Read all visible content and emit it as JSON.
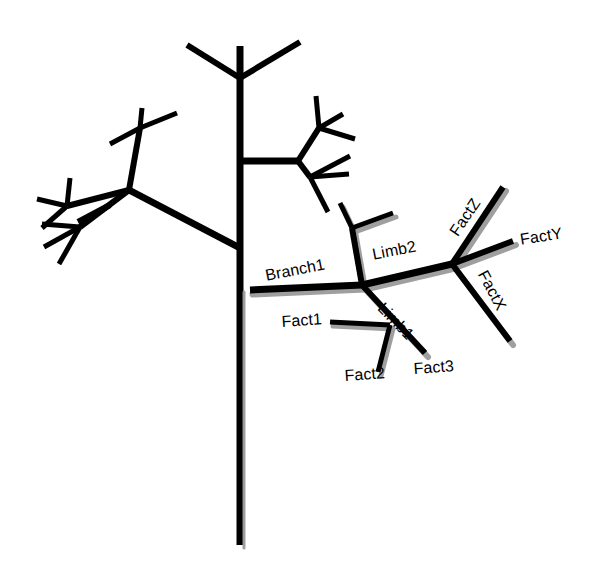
{
  "diagram": {
    "type": "fractal-branching-tree",
    "background_color": "#ffffff",
    "line_color": "#000000",
    "shadow_color": "#9a9a9a",
    "title": "",
    "labels": [
      {
        "id": "branch1",
        "text": "Branch1",
        "x": 264,
        "y": 268,
        "rotate": -11
      },
      {
        "id": "limb2",
        "text": "Limb2",
        "x": 371,
        "y": 247,
        "rotate": -11
      },
      {
        "id": "limb1",
        "text": "Limb1",
        "x": 386,
        "y": 300,
        "rotate": 46
      },
      {
        "id": "fact1",
        "text": "Fact1",
        "x": 281,
        "y": 314,
        "rotate": -4
      },
      {
        "id": "fact2",
        "text": "Fact2",
        "x": 344,
        "y": 368,
        "rotate": -4
      },
      {
        "id": "fact3",
        "text": "Fact3",
        "x": 413,
        "y": 361,
        "rotate": -4
      },
      {
        "id": "factx",
        "text": "FactX",
        "x": 489,
        "y": 268,
        "rotate": 62
      },
      {
        "id": "facty",
        "text": "FactY",
        "x": 519,
        "y": 232,
        "rotate": -9
      },
      {
        "id": "factz",
        "text": "FactZ",
        "x": 447,
        "y": 230,
        "rotate": -56
      }
    ],
    "labeled_nodes": [
      {
        "name": "trunk-branch1-junction",
        "x": 250,
        "y": 290
      },
      {
        "name": "branch1-limb-junction",
        "x": 362,
        "y": 285
      },
      {
        "name": "limb2-fact-junction",
        "x": 452,
        "y": 264
      },
      {
        "name": "limb1-fact-junction",
        "x": 390,
        "y": 325
      }
    ],
    "plain_branches": [
      {
        "name": "trunk",
        "d": "M 240 46 L 240 545"
      },
      {
        "name": "trunk-top-fork-left",
        "d": "M 240 78 L 187 45"
      },
      {
        "name": "trunk-top-fork-right",
        "d": "M 240 78 L 300 42"
      },
      {
        "name": "left-main-branch",
        "d": "M 240 248 L 129 190"
      },
      {
        "name": "left-upper-sub",
        "d": "M 129 190 L 140 128"
      },
      {
        "name": "left-upper-tip-a",
        "d": "M 140 128 L 110 144"
      },
      {
        "name": "left-upper-tip-b",
        "d": "M 140 128 L 142 108"
      },
      {
        "name": "left-upper-tip-c",
        "d": "M 140 128 L 177 113"
      },
      {
        "name": "left-lower-sub",
        "d": "M 129 190 L 67 206"
      },
      {
        "name": "left-lower-tip-a",
        "d": "M 67 206 L 70 178"
      },
      {
        "name": "left-lower-tip-b",
        "d": "M 67 206 L 37 199"
      },
      {
        "name": "left-lower-tip-c",
        "d": "M 67 206 L 42 228"
      },
      {
        "name": "left-mid-sub",
        "d": "M 110 205 L 78 222"
      },
      {
        "name": "left-mid-fork",
        "d": "M 129 190 L 80 227"
      },
      {
        "name": "left-mid-tip-a",
        "d": "M 80 227 L 42 224"
      },
      {
        "name": "left-mid-tip-b",
        "d": "M 80 227 L 44 247"
      },
      {
        "name": "left-mid-tip-c",
        "d": "M 80 227 L 59 264"
      },
      {
        "name": "right-main-branch",
        "d": "M 240 161 L 298 161"
      },
      {
        "name": "right-upper-sub",
        "d": "M 298 161 L 319 128"
      },
      {
        "name": "right-upper-tip-a",
        "d": "M 319 128 L 316 96"
      },
      {
        "name": "right-upper-tip-b",
        "d": "M 319 128 L 343 114"
      },
      {
        "name": "right-upper-tip-c",
        "d": "M 319 128 L 355 139"
      },
      {
        "name": "right-lower-sub",
        "d": "M 298 161 L 310 177"
      },
      {
        "name": "right-lower-tip-a",
        "d": "M 310 177 L 350 156"
      },
      {
        "name": "right-lower-tip-b",
        "d": "M 310 177 L 349 174"
      },
      {
        "name": "right-lower-tip-c",
        "d": "M 310 177 L 328 212"
      }
    ],
    "labeled_branches": [
      {
        "name": "branch1-segment",
        "d": "M 250 290 L 362 285",
        "width": 7
      },
      {
        "name": "branch1-to-node",
        "d": "M 362 285 L 452 264",
        "width": 7
      },
      {
        "name": "limb2-stem",
        "d": "M 362 285 L 352 228",
        "width": 6
      },
      {
        "name": "limb2-tip-left",
        "d": "M 352 228 L 340 203",
        "width": 5
      },
      {
        "name": "limb2-tip-right",
        "d": "M 352 228 L 393 213",
        "width": 5
      },
      {
        "name": "limb1-stem",
        "d": "M 362 285 L 425 353",
        "width": 6
      },
      {
        "name": "fact1-tip",
        "d": "M 390 325 L 330 322",
        "width": 5
      },
      {
        "name": "fact2-tip",
        "d": "M 390 325 L 378 372",
        "width": 5
      },
      {
        "name": "factz-arm",
        "d": "M 452 264 L 503 187",
        "width": 6
      },
      {
        "name": "facty-arm",
        "d": "M 452 264 L 513 241",
        "width": 6
      },
      {
        "name": "factx-arm",
        "d": "M 452 264 L 510 341",
        "width": 6
      }
    ]
  }
}
